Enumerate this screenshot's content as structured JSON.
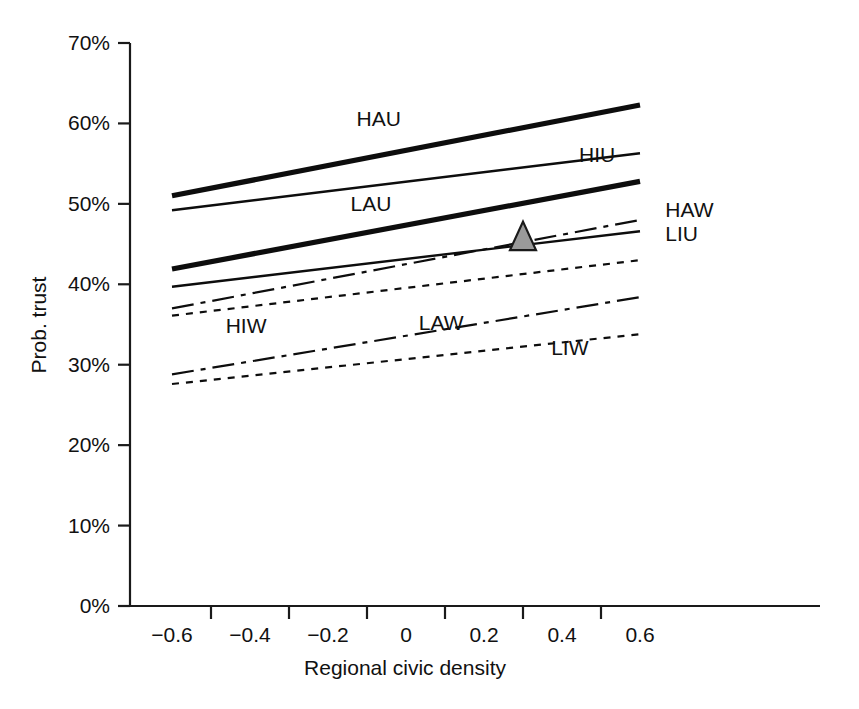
{
  "chart_data": {
    "type": "line",
    "title": "",
    "xlabel": "Regional civic density",
    "ylabel": "Prob. trust",
    "xlim": [
      -0.72,
      0.72
    ],
    "ylim": [
      0,
      70
    ],
    "grid": false,
    "legend_position": "inline-labels",
    "x_ticks": [
      -0.6,
      -0.4,
      -0.2,
      0,
      0.2,
      0.4,
      0.6
    ],
    "x_tick_labels": [
      "−0.6",
      "−0.4",
      "−0.2",
      "0",
      "0.2",
      "0.4",
      "0.6"
    ],
    "x_minor_ticks": [
      -0.5,
      -0.3,
      -0.1,
      0.1,
      0.3,
      0.5
    ],
    "y_ticks": [
      0,
      10,
      20,
      30,
      40,
      50,
      60,
      70
    ],
    "y_tick_labels": [
      "0%",
      "10%",
      "20%",
      "30%",
      "40%",
      "50%",
      "60%",
      "70%"
    ],
    "x": [
      -0.6,
      0.6
    ],
    "series": [
      {
        "name": "HAU",
        "label": "HAU",
        "style": "solid-thick",
        "values": [
          51.0,
          62.3
        ],
        "label_x": -0.07,
        "label_y": 59.7,
        "label_anchor": "middle"
      },
      {
        "name": "HIU",
        "label": "HIU",
        "style": "solid-thin",
        "values": [
          49.2,
          56.3
        ],
        "label_x": 0.49,
        "label_y": 55.2,
        "label_anchor": "middle"
      },
      {
        "name": "LAU",
        "label": "LAU",
        "style": "solid-thick",
        "values": [
          41.9,
          52.8
        ],
        "label_x": -0.09,
        "label_y": 49.1,
        "label_anchor": "middle"
      },
      {
        "name": "HAW",
        "label": "HAW",
        "style": "dash-dot",
        "values": [
          37.0,
          48.0
        ],
        "label_x": 0.665,
        "label_y": 48.4,
        "label_anchor": "start"
      },
      {
        "name": "LIU",
        "label": "LIU",
        "style": "solid-thin",
        "values": [
          39.7,
          46.6
        ],
        "label_x": 0.665,
        "label_y": 45.4,
        "label_anchor": "start"
      },
      {
        "name": "HIW",
        "label": "HIW",
        "style": "dotted",
        "values": [
          36.1,
          43.0
        ],
        "label_x": -0.41,
        "label_y": 34.0,
        "label_anchor": "middle"
      },
      {
        "name": "LAW",
        "label": "LAW",
        "style": "dash-dot",
        "values": [
          28.8,
          38.4
        ],
        "label_x": 0.09,
        "label_y": 34.3,
        "label_anchor": "middle"
      },
      {
        "name": "LIW",
        "label": "LIW",
        "style": "dotted",
        "values": [
          27.6,
          33.8
        ],
        "label_x": 0.42,
        "label_y": 31.2,
        "label_anchor": "middle"
      }
    ],
    "markers": [
      {
        "name": "highlight-triangle",
        "shape": "triangle",
        "x": 0.3,
        "y": 45.8,
        "fill": "#9a9a9a",
        "stroke": "#1a1a1a"
      }
    ],
    "colors": {
      "line": "#0d0d0d",
      "axis": "#1a1a1a",
      "marker_fill": "#9a9a9a",
      "background": "#ffffff"
    }
  }
}
